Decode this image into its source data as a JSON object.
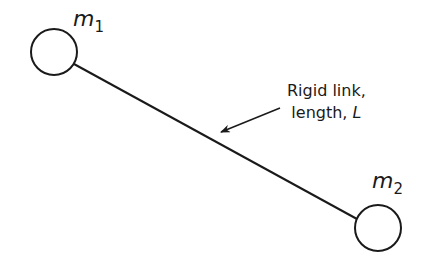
{
  "diagram": {
    "masses": [
      {
        "symbol": "m",
        "subscript": "1",
        "cx": 54,
        "cy": 52,
        "r": 23
      },
      {
        "symbol": "m",
        "subscript": "2",
        "cx": 378,
        "cy": 228,
        "r": 23
      }
    ],
    "link": {
      "x1": 74,
      "y1": 64,
      "x2": 357,
      "y2": 219,
      "stroke": "#1a1a1a"
    },
    "annotation": {
      "line1": "Rigid link,",
      "line2_prefix": "length,",
      "line2_var": "L"
    },
    "arrow": {
      "x1": 280,
      "y1": 108,
      "x2": 221,
      "y2": 132
    }
  }
}
